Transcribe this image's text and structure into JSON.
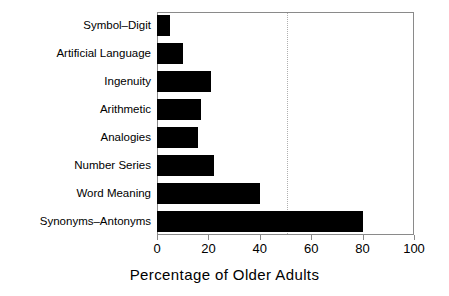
{
  "chart_data": {
    "type": "bar",
    "orientation": "horizontal",
    "title": "",
    "xlabel": "Percentage of Older Adults",
    "ylabel": "",
    "categories": [
      "Symbol–Digit",
      "Artificial Language",
      "Ingenuity",
      "Arithmetic",
      "Analogies",
      "Number Series",
      "Word Meaning",
      "Synonyms–Antonyms"
    ],
    "values": [
      5,
      10,
      21,
      17,
      16,
      22,
      40,
      80
    ],
    "xlim": [
      0,
      100
    ],
    "xticks": [
      0,
      20,
      40,
      60,
      80,
      100
    ],
    "xtick_labels": [
      "0",
      "20",
      "40",
      "60",
      "80",
      "100"
    ],
    "grid": false,
    "legend": null,
    "annotations": [
      {
        "name": "reference-line",
        "type": "vertical-dotted-line",
        "value": 50,
        "color": "#b0b0b0"
      }
    ],
    "bar_color": "#000000",
    "frame_color": "#8a8a8a",
    "background_color": "#ffffff"
  }
}
